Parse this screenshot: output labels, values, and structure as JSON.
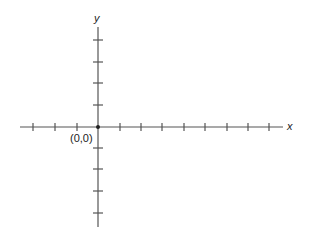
{
  "diagram": {
    "type": "coordinate-plane",
    "x_axis_label": "x",
    "y_axis_label": "y",
    "origin_label": "(0,0)",
    "ticks": {
      "x_positive": 8,
      "x_negative": 3,
      "y_positive": 4,
      "y_negative": 4
    },
    "colors": {
      "axis": "#555555",
      "text": "#222222",
      "background": "#ffffff"
    }
  }
}
